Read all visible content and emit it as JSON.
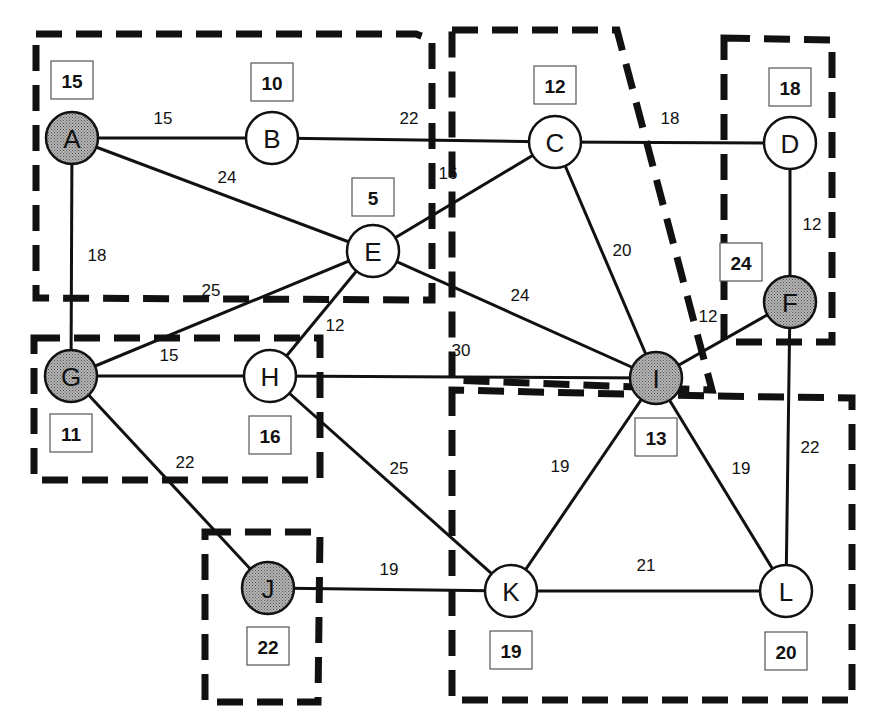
{
  "diagram": {
    "type": "weighted-graph-with-regions",
    "colors": {
      "shaded_node": "#a0a0a0",
      "plain_node": "#ffffff",
      "line": "#111111"
    },
    "nodes": [
      {
        "id": "A",
        "label": "A",
        "x": 72,
        "y": 138,
        "shaded": true,
        "weight": "15",
        "box_x": 72,
        "box_y": 80
      },
      {
        "id": "B",
        "label": "B",
        "x": 272,
        "y": 138,
        "shaded": false,
        "weight": "10",
        "box_x": 272,
        "box_y": 82
      },
      {
        "id": "C",
        "label": "C",
        "x": 555,
        "y": 142,
        "shaded": false,
        "weight": "12",
        "box_x": 555,
        "box_y": 85
      },
      {
        "id": "D",
        "label": "D",
        "x": 790,
        "y": 143,
        "shaded": false,
        "weight": "18",
        "box_x": 790,
        "box_y": 87
      },
      {
        "id": "E",
        "label": "E",
        "x": 373,
        "y": 251,
        "shaded": false,
        "weight": "5",
        "box_x": 373,
        "box_y": 197
      },
      {
        "id": "F",
        "label": "F",
        "x": 790,
        "y": 302,
        "shaded": true,
        "weight": "24",
        "box_x": 741,
        "box_y": 262
      },
      {
        "id": "G",
        "label": "G",
        "x": 71,
        "y": 376,
        "shaded": true,
        "weight": "11",
        "box_x": 71,
        "box_y": 433
      },
      {
        "id": "H",
        "label": "H",
        "x": 270,
        "y": 376,
        "shaded": false,
        "weight": "16",
        "box_x": 270,
        "box_y": 435
      },
      {
        "id": "I",
        "label": "I",
        "x": 656,
        "y": 378,
        "shaded": true,
        "weight": "13",
        "box_x": 656,
        "box_y": 437
      },
      {
        "id": "J",
        "label": "J",
        "x": 268,
        "y": 588,
        "shaded": true,
        "weight": "22",
        "box_x": 268,
        "box_y": 646
      },
      {
        "id": "K",
        "label": "K",
        "x": 511,
        "y": 591,
        "shaded": false,
        "weight": "19",
        "box_x": 511,
        "box_y": 650
      },
      {
        "id": "L",
        "label": "L",
        "x": 786,
        "y": 591,
        "shaded": false,
        "weight": "20",
        "box_x": 786,
        "box_y": 651
      }
    ],
    "edges": [
      {
        "from": "A",
        "to": "B",
        "weight": "15",
        "lx": 163,
        "ly": 118
      },
      {
        "from": "B",
        "to": "C",
        "weight": "22",
        "lx": 409,
        "ly": 118
      },
      {
        "from": "C",
        "to": "D",
        "weight": "18",
        "lx": 670,
        "ly": 118
      },
      {
        "from": "A",
        "to": "E",
        "weight": "24",
        "lx": 227,
        "ly": 177
      },
      {
        "from": "A",
        "to": "G",
        "weight": "18",
        "lx": 97,
        "ly": 255
      },
      {
        "from": "E",
        "to": "C",
        "weight": "16",
        "lx": 448,
        "ly": 173
      },
      {
        "from": "C",
        "to": "I",
        "weight": "20",
        "lx": 622,
        "ly": 250
      },
      {
        "from": "D",
        "to": "F",
        "weight": "12",
        "lx": 812,
        "ly": 224
      },
      {
        "from": "E",
        "to": "G",
        "weight": "25",
        "lx": 211,
        "ly": 290
      },
      {
        "from": "E",
        "to": "H",
        "weight": "12",
        "lx": 335,
        "ly": 325
      },
      {
        "from": "E",
        "to": "I",
        "weight": "24",
        "lx": 520,
        "ly": 295
      },
      {
        "from": "I",
        "to": "F",
        "weight": "12",
        "lx": 708,
        "ly": 316
      },
      {
        "from": "G",
        "to": "H",
        "weight": "15",
        "lx": 169,
        "ly": 355
      },
      {
        "from": "H",
        "to": "I",
        "weight": "30",
        "lx": 461,
        "ly": 350
      },
      {
        "from": "G",
        "to": "J",
        "weight": "22",
        "lx": 185,
        "ly": 462
      },
      {
        "from": "H",
        "to": "K",
        "weight": "25",
        "lx": 399,
        "ly": 468
      },
      {
        "from": "I",
        "to": "K",
        "weight": "19",
        "lx": 560,
        "ly": 466
      },
      {
        "from": "I",
        "to": "L",
        "weight": "19",
        "lx": 741,
        "ly": 468
      },
      {
        "from": "F",
        "to": "L",
        "weight": "22",
        "lx": 810,
        "ly": 447
      },
      {
        "from": "J",
        "to": "K",
        "weight": "19",
        "lx": 389,
        "ly": 569
      },
      {
        "from": "K",
        "to": "L",
        "weight": "21",
        "lx": 646,
        "ly": 565
      }
    ],
    "regions": [
      {
        "id": "region-top-left",
        "points": "36,34 416,34 432,40 432,300 36,298"
      },
      {
        "id": "region-top-middle",
        "points": "452,30 617,30 712,390 452,380"
      },
      {
        "id": "region-top-right",
        "points": "724,38 832,40 832,342 724,342"
      },
      {
        "id": "region-left-middle",
        "points": "34,338 320,338 320,480 34,480"
      },
      {
        "id": "region-bottom-left",
        "points": "205,532 320,532 318,702 205,702"
      },
      {
        "id": "region-bottom-right",
        "points": "452,390 452,700 852,700 852,398 710,396"
      }
    ]
  }
}
